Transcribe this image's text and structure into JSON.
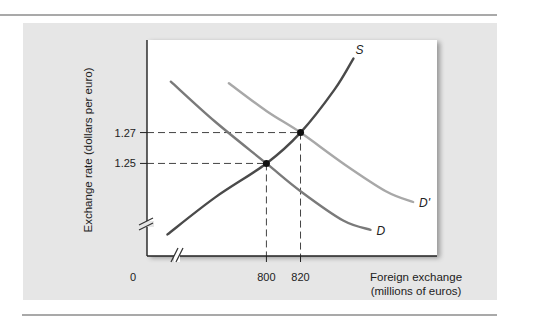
{
  "chart_data": {
    "type": "line",
    "title": "",
    "xlabel_line1": "Foreign exchange",
    "xlabel_line2": "(millions of euros)",
    "ylabel": "Exchange rate (dollars per euro)",
    "origin_label": "0",
    "axis_breaks": true,
    "grid": false,
    "x_ticks": [
      {
        "value": 800,
        "label": "800"
      },
      {
        "value": 820,
        "label": "820"
      }
    ],
    "y_ticks": [
      {
        "value": 1.25,
        "label": "1.25"
      },
      {
        "value": 1.27,
        "label": "1.27"
      }
    ],
    "xlim": [
      730,
      900
    ],
    "ylim": [
      1.19,
      1.33
    ],
    "series": [
      {
        "name": "S",
        "label": "S",
        "color": "#4a4a4a",
        "points": [
          [
            742,
            1.204
          ],
          [
            770,
            1.228
          ],
          [
            800,
            1.25
          ],
          [
            820,
            1.27
          ],
          [
            840,
            1.298
          ],
          [
            851,
            1.318
          ]
        ]
      },
      {
        "name": "D",
        "label": "D",
        "color": "#7a7a7a",
        "points": [
          [
            744,
            1.303
          ],
          [
            770,
            1.277
          ],
          [
            800,
            1.25
          ],
          [
            820,
            1.232
          ],
          [
            845,
            1.213
          ],
          [
            861,
            1.207
          ]
        ]
      },
      {
        "name": "D'",
        "label": "D'",
        "color": "#a8a8a8",
        "points": [
          [
            778,
            1.302
          ],
          [
            800,
            1.284
          ],
          [
            820,
            1.27
          ],
          [
            845,
            1.25
          ],
          [
            870,
            1.232
          ],
          [
            886,
            1.225
          ]
        ]
      }
    ],
    "equilibria": [
      {
        "x": 800,
        "y": 1.25
      },
      {
        "x": 820,
        "y": 1.27
      }
    ]
  }
}
